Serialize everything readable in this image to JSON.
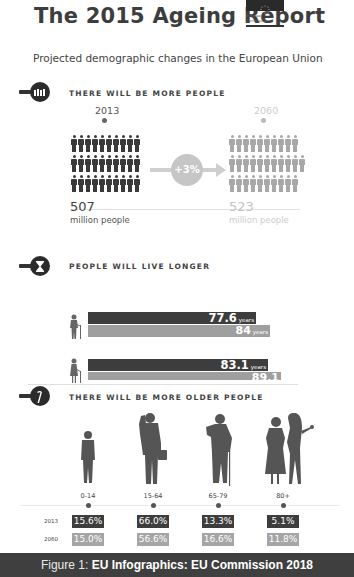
{
  "header": {
    "title": "The 2015 Ageing Report",
    "logo_text_line1": "European",
    "logo_text_line2": "Commission",
    "subtitle": "Projected demographic changes in the European Union"
  },
  "section_population": {
    "icon": "crowd-icon",
    "heading": "THERE WILL BE MORE PEOPLE",
    "year_start": "2013",
    "year_end": "2060",
    "change": "+3%",
    "value_start": "507",
    "value_end": "523",
    "unit": "million people",
    "colors": {
      "start": "#3a3a3a",
      "end": "#a8a8a8"
    }
  },
  "section_longevity": {
    "icon": "hourglass-icon",
    "heading": "PEOPLE WILL LIVE LONGER",
    "rows": [
      {
        "gender": "male",
        "icon": "elderly-man-icon",
        "value_2013": "77.6",
        "value_2060": "84",
        "unit": "years",
        "width_2013": 168,
        "width_2060": 182
      },
      {
        "gender": "female",
        "icon": "elderly-woman-icon",
        "value_2013": "83.1",
        "value_2060": "89.1",
        "unit": "years",
        "width_2013": 180,
        "width_2060": 193
      }
    ]
  },
  "section_older": {
    "icon": "cane-icon",
    "heading": "THERE WILL BE MORE OLDER PEOPLE",
    "row_labels": [
      "2013",
      "2060"
    ],
    "groups": [
      {
        "label": "0-14",
        "icon": "child-icon",
        "v2013": "15.6%",
        "v2060": "15.0%"
      },
      {
        "label": "15-64",
        "icon": "working-adult-icon",
        "v2013": "66.0%",
        "v2060": "56.6%"
      },
      {
        "label": "65-79",
        "icon": "elderly-man-cane-icon",
        "v2013": "13.3%",
        "v2060": "16.6%"
      },
      {
        "label": "80+",
        "icon": "very-old-with-carer-icon",
        "v2013": "5.1%",
        "v2060": "11.8%"
      }
    ]
  },
  "footer": {
    "prefix": "Figure 1: ",
    "caption": "EU Infographics: EU Commission 2018"
  }
}
